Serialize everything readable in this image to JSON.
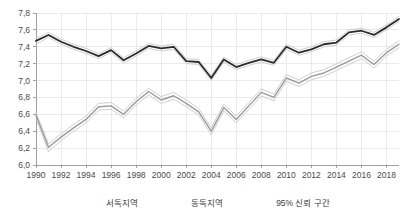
{
  "chart_data": {
    "type": "line",
    "title": "",
    "xlabel": "",
    "ylabel": "",
    "decimal_separator": ",",
    "grid": true,
    "legend_position": "bottom",
    "xlim": [
      1990,
      2019
    ],
    "ylim": [
      6.0,
      7.8
    ],
    "x": [
      1990,
      1991,
      1992,
      1993,
      1994,
      1995,
      1996,
      1997,
      1998,
      1999,
      2000,
      2001,
      2002,
      2003,
      2004,
      2005,
      2006,
      2007,
      2008,
      2009,
      2010,
      2011,
      2012,
      2013,
      2014,
      2015,
      2016,
      2017,
      2018,
      2019
    ],
    "x_tick_labels": [
      "1990",
      "1992",
      "1994",
      "1996",
      "1998",
      "2000",
      "2002",
      "2004",
      "2006",
      "2008",
      "2010",
      "2012",
      "2014",
      "2016",
      "2018"
    ],
    "y_tick_labels": [
      "6,0",
      "6,2",
      "6,4",
      "6,6",
      "6,8",
      "7,0",
      "7,2",
      "7,4",
      "7,6",
      "7,8"
    ],
    "y_ticks": [
      6.0,
      6.2,
      6.4,
      6.6,
      6.8,
      7.0,
      7.2,
      7.4,
      7.6,
      7.8
    ],
    "series": [
      {
        "name": "서독지역",
        "color": "#2b2b2b",
        "width": 1.8,
        "values": [
          7.47,
          7.54,
          7.46,
          7.4,
          7.35,
          7.29,
          7.36,
          7.24,
          7.32,
          7.41,
          7.38,
          7.4,
          7.23,
          7.22,
          7.03,
          7.25,
          7.16,
          7.21,
          7.25,
          7.21,
          7.4,
          7.33,
          7.37,
          7.43,
          7.45,
          7.57,
          7.59,
          7.54,
          7.63,
          7.73
        ],
        "ci_upper": [
          7.5,
          7.57,
          7.49,
          7.43,
          7.38,
          7.32,
          7.39,
          7.27,
          7.35,
          7.44,
          7.41,
          7.43,
          7.26,
          7.25,
          7.06,
          7.28,
          7.19,
          7.24,
          7.28,
          7.24,
          7.43,
          7.36,
          7.4,
          7.46,
          7.48,
          7.6,
          7.62,
          7.57,
          7.66,
          7.76
        ],
        "ci_lower": [
          7.43,
          7.51,
          7.43,
          7.37,
          7.32,
          7.26,
          7.33,
          7.21,
          7.29,
          7.38,
          7.35,
          7.37,
          7.2,
          7.19,
          7.0,
          7.22,
          7.13,
          7.18,
          7.22,
          7.18,
          7.37,
          7.3,
          7.34,
          7.4,
          7.42,
          7.54,
          7.56,
          7.51,
          7.6,
          7.7
        ]
      },
      {
        "name": "동독지역",
        "color": "#9a9a9a",
        "width": 1.4,
        "values": [
          6.59,
          6.21,
          6.33,
          6.44,
          6.54,
          6.69,
          6.7,
          6.6,
          6.75,
          6.87,
          6.77,
          6.82,
          6.73,
          6.63,
          6.4,
          6.68,
          6.54,
          6.7,
          6.86,
          6.8,
          7.03,
          6.97,
          7.05,
          7.09,
          7.16,
          7.23,
          7.3,
          7.19,
          7.33,
          7.43
        ]
      }
    ],
    "ci_band": {
      "name": "95% 신뢰 구간",
      "color": "#c9c9c9",
      "width": 0.9,
      "east_upper": [
        6.62,
        6.25,
        6.37,
        6.48,
        6.58,
        6.73,
        6.74,
        6.64,
        6.79,
        6.91,
        6.81,
        6.86,
        6.77,
        6.67,
        6.44,
        6.72,
        6.58,
        6.74,
        6.9,
        6.84,
        7.07,
        7.01,
        7.09,
        7.13,
        7.2,
        7.27,
        7.34,
        7.23,
        7.37,
        7.47
      ],
      "east_lower": [
        6.55,
        6.16,
        6.29,
        6.4,
        6.5,
        6.65,
        6.66,
        6.56,
        6.71,
        6.83,
        6.73,
        6.78,
        6.69,
        6.59,
        6.36,
        6.64,
        6.5,
        6.66,
        6.82,
        6.76,
        6.99,
        6.93,
        7.01,
        7.05,
        7.12,
        7.19,
        7.26,
        7.15,
        7.29,
        7.39
      ]
    }
  },
  "legend": {
    "items": [
      {
        "label": "서독지역",
        "color": "#2b2b2b",
        "thickness": 2.2,
        "style": "solid"
      },
      {
        "label": "동독지역",
        "color": "#9a9a9a",
        "thickness": 1.6,
        "style": "solid"
      },
      {
        "label": "95% 신뢰 구간",
        "color": "#c9c9c9",
        "thickness": 1.1,
        "style": "dashed"
      }
    ]
  },
  "axes": {
    "y_axis_name": "value-axis",
    "x_axis_name": "year-axis"
  }
}
